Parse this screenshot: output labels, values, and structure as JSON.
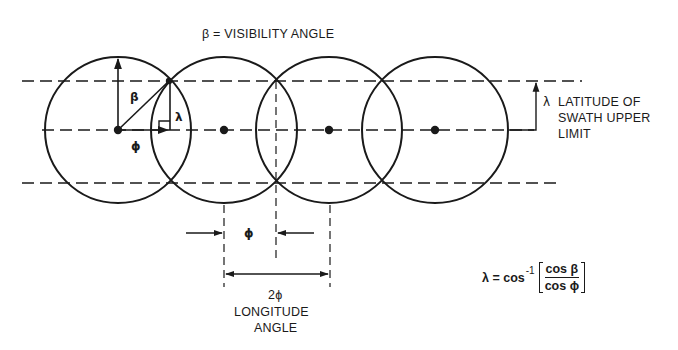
{
  "diagram": {
    "title": "β = VISIBILITY ANGLE",
    "circles": {
      "centers_x": [
        118,
        224,
        329,
        435
      ],
      "center_y": 130,
      "radius": 72
    },
    "lines": {
      "upper_swath_y": 81,
      "center_y": 130,
      "lower_swath_y": 183
    },
    "labels": {
      "beta": "β",
      "lambda": "λ",
      "phi": "ϕ",
      "phi_dimension": "ϕ",
      "two_phi": "2ϕ",
      "longitude_line1": "LONGITUDE",
      "longitude_line2": "ANGLE",
      "latitude_symbol": "λ",
      "latitude_line1": "LATITUDE OF",
      "latitude_line2": "SWATH UPPER",
      "latitude_line3": "LIMIT"
    },
    "formula": {
      "lhs": "λ = cos",
      "exponent": "-1",
      "numerator": "cos β",
      "denominator": "cos ϕ"
    },
    "colors": {
      "stroke": "#1a1a1a",
      "background": "#ffffff"
    }
  }
}
